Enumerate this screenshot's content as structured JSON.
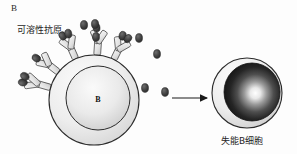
{
  "figure": {
    "panel_label": "B",
    "antigen_label": "可溶性抗原",
    "result_label": "失能B细胞",
    "cell_label": "B",
    "arrow": "right-arrow",
    "colors": {
      "outline": "#2b2b2b",
      "cytoplasm_light": "#f2f2f2",
      "cytoplasm_shade": "#d8d8d8",
      "nucleus_light": "#f4f4f4",
      "nucleus_shade": "#cfcfcf",
      "antigen_dark": "#3a3a3a",
      "receptor_fill": "#e6e6e6",
      "anergic_nucleus_dark": "#1c1c1c",
      "anergic_highlight": "#ffffff",
      "background": "#fdfdfd"
    }
  },
  "elements": {
    "left_cell": {
      "name": "b-cell",
      "cx": 94,
      "cy": 100,
      "r_outer": 46,
      "r_nucleus": 32
    },
    "right_cell": {
      "name": "anergic-b-cell",
      "cx": 247,
      "cy": 93,
      "r_outer": 35,
      "r_nucleus": 28
    },
    "free_antigens": [
      {
        "x": 84,
        "y": 24
      },
      {
        "x": 95,
        "y": 23
      },
      {
        "x": 95,
        "y": 36
      },
      {
        "x": 118,
        "y": 37
      },
      {
        "x": 139,
        "y": 52
      },
      {
        "x": 157,
        "y": 53
      },
      {
        "x": 137,
        "y": 88
      },
      {
        "x": 158,
        "y": 93
      },
      {
        "x": 110,
        "y": 41
      }
    ],
    "receptors": [
      {
        "angle": -78,
        "name": "bcr-receptor-1"
      },
      {
        "angle": -60,
        "name": "bcr-receptor-2"
      },
      {
        "angle": -28,
        "name": "bcr-receptor-3"
      },
      {
        "angle": 2,
        "name": "bcr-receptor-4"
      },
      {
        "angle": 22,
        "name": "bcr-receptor-5"
      }
    ],
    "arrow": {
      "x1": 170,
      "y1": 98,
      "x2": 208,
      "y2": 98
    }
  }
}
